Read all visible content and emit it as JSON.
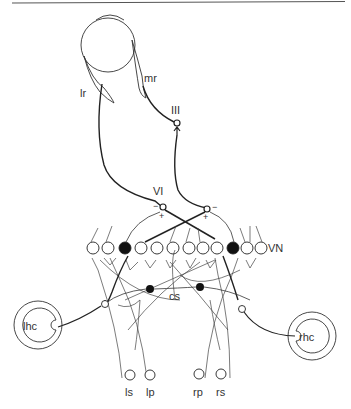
{
  "diagram": {
    "type": "neural-circuit",
    "labels": {
      "lr": "lr",
      "mr": "mr",
      "nucleus_III": "III",
      "nucleus_VI": "VI",
      "vn": "VN",
      "cs": "cs",
      "lhc": "lhc",
      "rhc": "rhc",
      "ls": "ls",
      "lp": "lp",
      "rp": "rp",
      "rs": "rs",
      "minus_left": "−",
      "plus_left": "+",
      "minus_right": "−",
      "plus_right": "+"
    },
    "colors": {
      "line": "#2a2a2a",
      "fill_dark": "#111111",
      "background": "#ffffff"
    },
    "vn_neurons": [
      {
        "x": 93,
        "filled": false
      },
      {
        "x": 108,
        "filled": false
      },
      {
        "x": 125,
        "filled": true
      },
      {
        "x": 141,
        "filled": false
      },
      {
        "x": 157,
        "filled": false
      },
      {
        "x": 173,
        "filled": false
      },
      {
        "x": 189,
        "filled": false
      },
      {
        "x": 203,
        "filled": false
      },
      {
        "x": 217,
        "filled": false
      },
      {
        "x": 233,
        "filled": true
      },
      {
        "x": 247,
        "filled": false
      },
      {
        "x": 261,
        "filled": false
      }
    ]
  }
}
